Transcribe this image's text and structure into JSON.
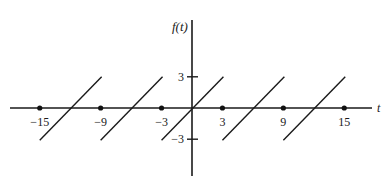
{
  "chart_data": {
    "type": "line",
    "title": "",
    "xlabel": "t",
    "ylabel": "f(t)",
    "period": 6,
    "x_ticks": [
      -15,
      -9,
      -3,
      3,
      9,
      15
    ],
    "x_tick_labels": [
      "−15",
      "−9",
      "−3",
      "3",
      "9",
      "15"
    ],
    "y_ticks": [
      3,
      -3
    ],
    "y_tick_labels": [
      "3",
      "−3"
    ],
    "xlim": [
      -18,
      18
    ],
    "ylim": [
      -4,
      8
    ],
    "series": [
      {
        "name": "f(t) segment 1",
        "x": [
          -15,
          -9
        ],
        "y": [
          -3,
          3
        ]
      },
      {
        "name": "f(t) segment 2",
        "x": [
          -9,
          -3
        ],
        "y": [
          -3,
          3
        ]
      },
      {
        "name": "f(t) segment 3",
        "x": [
          -3,
          3
        ],
        "y": [
          -3,
          3
        ]
      },
      {
        "name": "f(t) segment 4",
        "x": [
          3,
          9
        ],
        "y": [
          -3,
          3
        ]
      },
      {
        "name": "f(t) segment 5",
        "x": [
          9,
          15
        ],
        "y": [
          -3,
          3
        ]
      }
    ],
    "dots": [
      -15,
      -9,
      -3,
      3,
      9,
      15
    ],
    "grid": false,
    "legend": null
  },
  "labels": {
    "y_axis": "f(t)",
    "x_axis": "t"
  }
}
